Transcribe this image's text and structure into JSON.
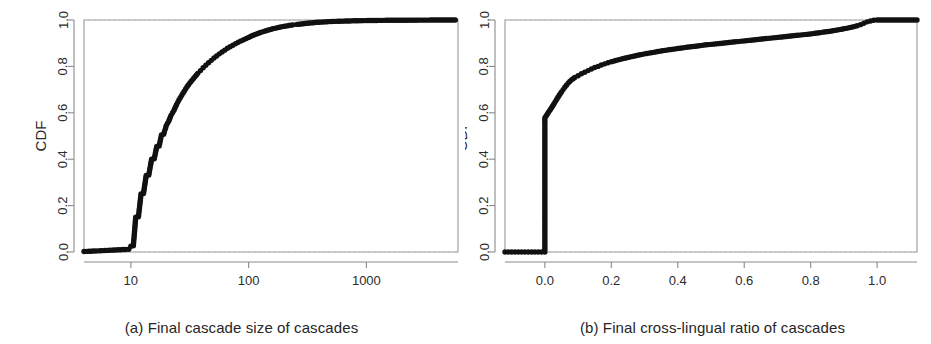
{
  "figure": {
    "background_color": "#ffffff",
    "marker_color": "#111111",
    "axis_color": "#8a8a8a"
  },
  "chart_data": [
    {
      "type": "scatter",
      "panel_id": "a",
      "title": "",
      "caption": "(a) Final cascade size of cascades",
      "xlabel": "",
      "ylabel": "CDF",
      "xscale": "log",
      "yscale": "linear",
      "xlim": [
        4,
        6000
      ],
      "ylim": [
        0.0,
        1.0
      ],
      "xticks": [
        10,
        100,
        1000
      ],
      "xticklabels": [
        "10",
        "100",
        "1000"
      ],
      "yticks": [
        0.0,
        0.2,
        0.4,
        0.6,
        0.8,
        1.0
      ],
      "yticklabels": [
        "0.0",
        "0.2",
        "0.4",
        "0.6",
        "0.8",
        "1.0"
      ],
      "grid": false,
      "legend": null,
      "marker": "filled-circle",
      "x": [
        4.0,
        4.4,
        4.8,
        5.3,
        5.8,
        6.3,
        6.9,
        7.5,
        8.2,
        9.0,
        9.6,
        10.0,
        10.5,
        11.0,
        11.6,
        12.2,
        12.8,
        13.5,
        14.2,
        15.0,
        15.8,
        16.6,
        17.4,
        18.2,
        19.0,
        20.0,
        21.0,
        22.0,
        23.2,
        24.4,
        25.6,
        27.0,
        28.4,
        30.0,
        31.6,
        33.3,
        35.1,
        37.0,
        39.0,
        41.1,
        43.3,
        45.7,
        48.2,
        50.8,
        53.5,
        56.4,
        59.5,
        62.7,
        66.1,
        69.7,
        73.5,
        77.5,
        81.7,
        86.1,
        90.8,
        95.7,
        100.0,
        108.0,
        117.0,
        126.0,
        137.0,
        148.0,
        160.0,
        173.0,
        187.0,
        203.0,
        220.0,
        238.0,
        257.0,
        279.0,
        302.0,
        327.0,
        354.0,
        383.0,
        415.0,
        449.0,
        486.0,
        526.0,
        570.0,
        617.0,
        668.0,
        723.0,
        783.0,
        848.0,
        918.0,
        994.0,
        1076.0,
        1165.0,
        1261.0,
        1365.0,
        1478.0,
        1600.0,
        1732.0,
        1875.0,
        2030.0,
        2198.0,
        2379.0,
        2575.0,
        2788.0,
        3018.0,
        3267.0,
        3537.0,
        3829.0,
        4145.0,
        4487.0,
        4857.0,
        5258.0,
        5690.0
      ],
      "y": [
        0.002,
        0.003,
        0.004,
        0.005,
        0.006,
        0.007,
        0.008,
        0.009,
        0.01,
        0.011,
        0.012,
        0.025,
        0.027,
        0.15,
        0.152,
        0.25,
        0.252,
        0.33,
        0.332,
        0.4,
        0.402,
        0.455,
        0.457,
        0.505,
        0.508,
        0.545,
        0.565,
        0.59,
        0.61,
        0.635,
        0.655,
        0.675,
        0.693,
        0.712,
        0.728,
        0.742,
        0.756,
        0.77,
        0.782,
        0.794,
        0.805,
        0.816,
        0.826,
        0.836,
        0.845,
        0.854,
        0.862,
        0.87,
        0.878,
        0.885,
        0.891,
        0.898,
        0.904,
        0.91,
        0.915,
        0.92,
        0.925,
        0.933,
        0.94,
        0.946,
        0.952,
        0.957,
        0.962,
        0.966,
        0.97,
        0.973,
        0.976,
        0.979,
        0.981,
        0.983,
        0.985,
        0.987,
        0.988,
        0.99,
        0.991,
        0.992,
        0.993,
        0.994,
        0.9945,
        0.995,
        0.9955,
        0.996,
        0.9965,
        0.997,
        0.9972,
        0.9975,
        0.9978,
        0.998,
        0.9982,
        0.9984,
        0.9986,
        0.9987,
        0.9988,
        0.999,
        0.9991,
        0.9992,
        0.9993,
        0.9994,
        0.9995,
        0.9995,
        0.9996,
        0.9997,
        0.9997,
        0.9998,
        0.9998,
        0.9999,
        0.9999,
        1.0
      ]
    },
    {
      "type": "scatter",
      "panel_id": "b",
      "title": "",
      "caption": "(b) Final cross-lingual ratio of cascades",
      "xlabel": "",
      "ylabel": "CDF",
      "xscale": "linear",
      "yscale": "linear",
      "xlim": [
        -0.12,
        1.12
      ],
      "ylim": [
        0.0,
        1.0
      ],
      "xticks": [
        0.0,
        0.2,
        0.4,
        0.6,
        0.8,
        1.0
      ],
      "xticklabels": [
        "0.0",
        "0.2",
        "0.4",
        "0.6",
        "0.8",
        "1.0"
      ],
      "yticks": [
        0.0,
        0.2,
        0.4,
        0.6,
        0.8,
        1.0
      ],
      "yticklabels": [
        "0.0",
        "0.2",
        "0.4",
        "0.6",
        "0.8",
        "1.0"
      ],
      "grid": false,
      "legend": null,
      "marker": "filled-circle",
      "x": [
        -0.12,
        -0.11,
        -0.1,
        -0.09,
        -0.08,
        -0.07,
        -0.06,
        -0.05,
        -0.04,
        -0.03,
        -0.02,
        -0.01,
        0.0,
        0.0,
        0.01,
        0.02,
        0.03,
        0.04,
        0.05,
        0.06,
        0.07,
        0.08,
        0.09,
        0.1,
        0.11,
        0.12,
        0.13,
        0.14,
        0.15,
        0.16,
        0.17,
        0.18,
        0.19,
        0.2,
        0.22,
        0.24,
        0.26,
        0.28,
        0.3,
        0.32,
        0.34,
        0.36,
        0.38,
        0.4,
        0.42,
        0.44,
        0.46,
        0.48,
        0.5,
        0.52,
        0.54,
        0.56,
        0.58,
        0.6,
        0.62,
        0.64,
        0.66,
        0.68,
        0.7,
        0.72,
        0.74,
        0.76,
        0.78,
        0.8,
        0.82,
        0.84,
        0.86,
        0.88,
        0.9,
        0.92,
        0.94,
        0.95,
        0.96,
        0.97,
        0.98,
        0.99,
        1.0,
        1.02,
        1.04,
        1.06,
        1.08,
        1.1,
        1.12
      ],
      "y": [
        0.0,
        0.0,
        0.0,
        0.0,
        0.0,
        0.0,
        0.0,
        0.0,
        0.0,
        0.0,
        0.0,
        0.0,
        0.0,
        0.578,
        0.6,
        0.622,
        0.645,
        0.668,
        0.69,
        0.71,
        0.728,
        0.742,
        0.752,
        0.76,
        0.768,
        0.775,
        0.782,
        0.789,
        0.795,
        0.8,
        0.806,
        0.811,
        0.816,
        0.82,
        0.828,
        0.835,
        0.842,
        0.848,
        0.854,
        0.859,
        0.864,
        0.869,
        0.873,
        0.877,
        0.881,
        0.885,
        0.888,
        0.892,
        0.895,
        0.898,
        0.901,
        0.904,
        0.907,
        0.91,
        0.913,
        0.916,
        0.919,
        0.922,
        0.925,
        0.928,
        0.931,
        0.934,
        0.937,
        0.94,
        0.944,
        0.948,
        0.952,
        0.957,
        0.962,
        0.968,
        0.975,
        0.98,
        0.986,
        0.992,
        0.996,
        0.999,
        1.0,
        1.0,
        1.0,
        1.0,
        1.0,
        1.0,
        1.0
      ]
    }
  ]
}
